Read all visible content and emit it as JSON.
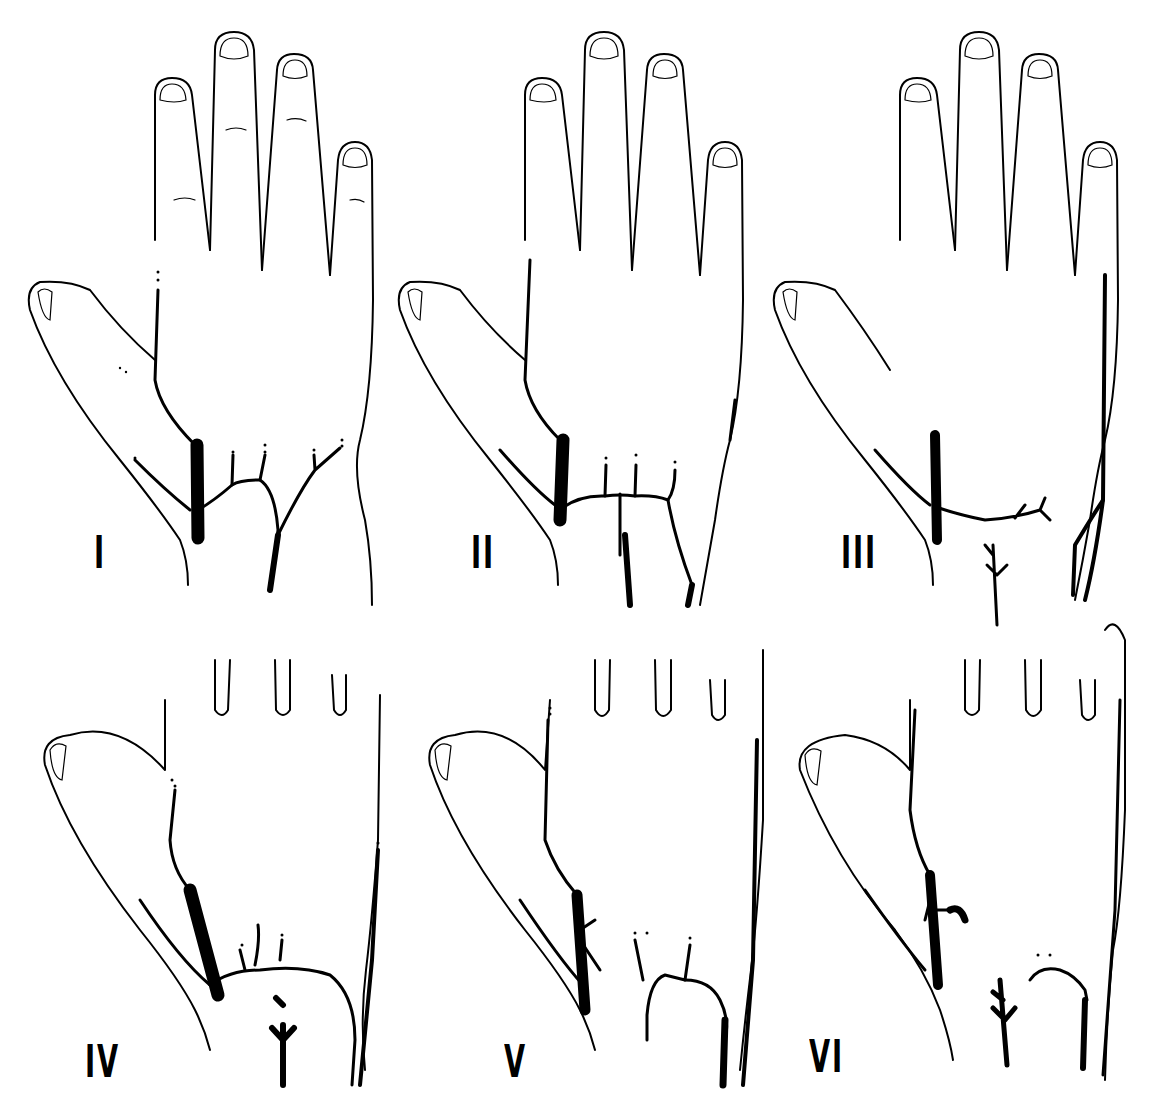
{
  "figure": {
    "panels": [
      {
        "id": "I",
        "label": "I",
        "row": 1,
        "col": 1
      },
      {
        "id": "II",
        "label": "II",
        "row": 1,
        "col": 2
      },
      {
        "id": "III",
        "label": "III",
        "row": 1,
        "col": 3
      },
      {
        "id": "IV",
        "label": "IV",
        "row": 2,
        "col": 1
      },
      {
        "id": "V",
        "label": "V",
        "row": 2,
        "col": 2
      },
      {
        "id": "VI",
        "label": "VI",
        "row": 2,
        "col": 3
      }
    ]
  }
}
